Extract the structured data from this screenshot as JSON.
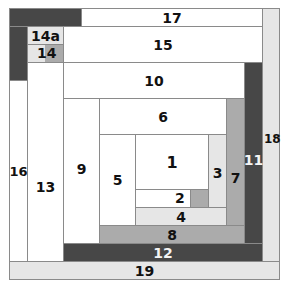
{
  "diagram": {
    "type": "log-cabin-quilt-block",
    "colors": {
      "white": "#ffffff",
      "light": "#e6e6e6",
      "mid": "#ababab",
      "dark": "#474747",
      "border": "#8a8a8a"
    },
    "pieces": {
      "p1": "1",
      "p2": "2",
      "p3": "3",
      "p4": "4",
      "p5": "5",
      "p6": "6",
      "p7": "7",
      "p8": "8",
      "p9": "9",
      "p10": "10",
      "p11": "11",
      "p12": "12",
      "p13": "13",
      "p14": "14",
      "p14a": "14a",
      "p15": "15",
      "p16": "16",
      "p17": "17",
      "p18": "18",
      "p19": "19"
    }
  }
}
